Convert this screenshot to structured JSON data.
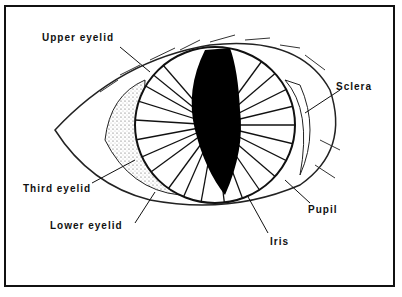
{
  "diagram": {
    "labels": [
      {
        "id": "upper-eyelid",
        "text": "Upper eyelid"
      },
      {
        "id": "sclera",
        "text": "Sclera"
      },
      {
        "id": "third-eyelid",
        "text": "Third eyelid"
      },
      {
        "id": "lower-eyelid",
        "text": "Lower eyelid"
      },
      {
        "id": "pupil",
        "text": "Pupil"
      },
      {
        "id": "iris",
        "text": "Iris"
      }
    ]
  }
}
